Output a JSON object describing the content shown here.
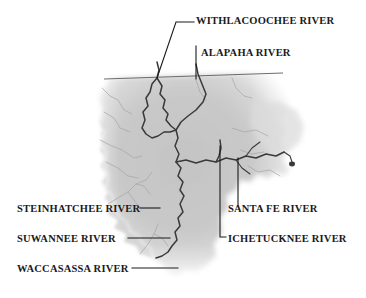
{
  "figure": {
    "type": "reference-map",
    "background_color": "#ffffff",
    "land_fill_color": "#c9c9c9",
    "river_line_color": "#3a3a3a",
    "tributary_line_color": "#9a9a9a",
    "state_line_color": "#5a5a5a",
    "leader_line_color": "#1a1a1a",
    "label_text_color": "#1a1a1a"
  },
  "labels": [
    {
      "id": "withlacoochee",
      "text": "WITHLACOOCHEE RIVER",
      "side": "top-right",
      "x": 196,
      "y": 16
    },
    {
      "id": "alapaha",
      "text": "ALAPAHA RIVER",
      "side": "top-right",
      "x": 201,
      "y": 48
    },
    {
      "id": "steinhatchee",
      "text": "STEINHATCHEE RIVER",
      "side": "left",
      "x": 17,
      "y": 204
    },
    {
      "id": "santafe",
      "text": "SANTA FE RIVER",
      "side": "right",
      "x": 228,
      "y": 204
    },
    {
      "id": "suwannee",
      "text": "SUWANNEE RIVER",
      "side": "left",
      "x": 17,
      "y": 234
    },
    {
      "id": "ichetucknee",
      "text": "ICHETUCKNEE RIVER",
      "side": "right",
      "x": 228,
      "y": 234
    },
    {
      "id": "waccasassa",
      "text": "WACCASASSA RIVER",
      "side": "left",
      "x": 17,
      "y": 264
    }
  ],
  "rivers": [
    {
      "id": "withlacoochee",
      "name": "WITHLACOOCHEE RIVER"
    },
    {
      "id": "alapaha",
      "name": "ALAPAHA RIVER"
    },
    {
      "id": "suwannee",
      "name": "SUWANNEE RIVER"
    },
    {
      "id": "santafe",
      "name": "SANTA FE RIVER"
    },
    {
      "id": "ichetucknee",
      "name": "ICHETUCKNEE RIVER"
    },
    {
      "id": "steinhatchee",
      "name": "STEINHATCHEE RIVER"
    },
    {
      "id": "waccasassa",
      "name": "WACCASASSA RIVER"
    }
  ]
}
